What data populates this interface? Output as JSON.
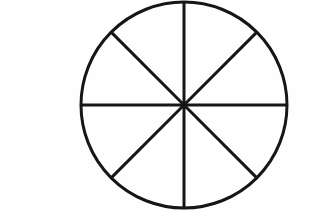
{
  "label": {
    "text": "D."
  },
  "colors": {
    "shaded": "#9a9a9a",
    "unshaded": "#ffffff",
    "outline": "#161616",
    "background": "#fefefe",
    "label_text": "#4a4a4a"
  },
  "chart_data": {
    "type": "pie",
    "xlabel": "",
    "ylabel": "",
    "legend": [],
    "grid": false,
    "total_slices": 8,
    "slice_angle_degrees": 45,
    "shaded_count": 6,
    "unshaded_count": 2,
    "fraction_shaded": "6/8",
    "fraction_shaded_decimal": 0.75,
    "center_x": 109,
    "center_y": 105,
    "radius": 103,
    "categories": [
      "slice-1",
      "slice-2",
      "slice-3",
      "slice-4",
      "slice-5",
      "slice-6",
      "slice-7",
      "slice-8"
    ],
    "values": [
      45,
      45,
      45,
      45,
      45,
      45,
      45,
      45
    ],
    "slices": [
      {
        "name": "slice-1",
        "start_deg": 270,
        "end_deg": 315,
        "shaded": true,
        "quadrant": "top-right"
      },
      {
        "name": "slice-2",
        "start_deg": 315,
        "end_deg": 0,
        "shaded": true,
        "quadrant": "top-right"
      },
      {
        "name": "slice-3",
        "start_deg": 0,
        "end_deg": 45,
        "shaded": true,
        "quadrant": "bottom-right"
      },
      {
        "name": "slice-4",
        "start_deg": 45,
        "end_deg": 90,
        "shaded": true,
        "quadrant": "bottom-right"
      },
      {
        "name": "slice-5",
        "start_deg": 90,
        "end_deg": 135,
        "shaded": false,
        "quadrant": "bottom-left"
      },
      {
        "name": "slice-6",
        "start_deg": 135,
        "end_deg": 180,
        "shaded": false,
        "quadrant": "bottom-left"
      },
      {
        "name": "slice-7",
        "start_deg": 180,
        "end_deg": 225,
        "shaded": true,
        "quadrant": "top-left"
      },
      {
        "name": "slice-8",
        "start_deg": 225,
        "end_deg": 270,
        "shaded": true,
        "quadrant": "top-left"
      }
    ]
  }
}
